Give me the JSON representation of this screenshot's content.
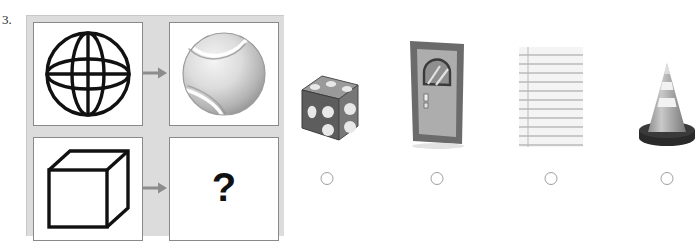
{
  "question": {
    "number": "3.",
    "prompt_symbol": "?"
  },
  "matrix": {
    "cells": [
      {
        "name": "wireframe-sphere",
        "label": "wireframe sphere",
        "position": "top-left"
      },
      {
        "name": "tennis-ball",
        "label": "tennis ball",
        "position": "top-right"
      },
      {
        "name": "wireframe-cube",
        "label": "wireframe cube",
        "position": "bottom-left"
      },
      {
        "name": "answer-placeholder",
        "label": "?",
        "position": "bottom-right"
      }
    ],
    "arrows": [
      {
        "name": "arrow-top",
        "glyph": "→"
      },
      {
        "name": "arrow-bottom",
        "glyph": "→"
      }
    ],
    "background_color": "#dcdcdc",
    "cell_border_color": "#8a8a8a",
    "arrow_color": "#8c8c8c"
  },
  "options": [
    {
      "id": "a",
      "name": "die",
      "label": "die",
      "selected": false
    },
    {
      "id": "b",
      "name": "door",
      "label": "door",
      "selected": false
    },
    {
      "id": "c",
      "name": "lined-paper",
      "label": "lined notebook paper",
      "selected": false
    },
    {
      "id": "d",
      "name": "traffic-cone",
      "label": "traffic cone",
      "selected": false
    }
  ],
  "colors": {
    "radio_border": "#9e9e9e",
    "ink": "#111111",
    "die_body": "#6e6e6e",
    "door_frame": "#6b6b6b",
    "cone_body": "#8f8f8f",
    "paper": "#f2f2f2"
  }
}
